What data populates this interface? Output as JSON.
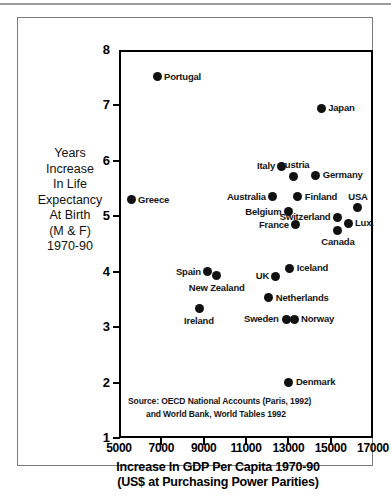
{
  "chart_data": {
    "type": "scatter",
    "title": "",
    "xlabel": "Increase In GDP Per Capita 1970-90 (US$ at Purchasing Power Parities)",
    "ylabel": "Years Increase In Life Expectancy At Birth (M & F) 1970-90",
    "xlim": [
      5000,
      17000
    ],
    "ylim": [
      1,
      8
    ],
    "xticks": [
      "5000",
      "7000",
      "9000",
      "11000",
      "13000",
      "15000",
      "17000"
    ],
    "xtick_values": [
      5000,
      7000,
      9000,
      11000,
      13000,
      15000,
      17000
    ],
    "yticks": [
      "1",
      "2",
      "3",
      "4",
      "5",
      "6",
      "7",
      "8"
    ],
    "ytick_values": [
      1,
      2,
      3,
      4,
      5,
      6,
      7,
      8
    ],
    "grid": false,
    "legend": "none",
    "points": [
      {
        "name": "Portugal",
        "x": 6800,
        "y": 7.52,
        "label_side": "right"
      },
      {
        "name": "Japan",
        "x": 14550,
        "y": 6.95,
        "label_side": "right"
      },
      {
        "name": "Italy",
        "x": 12700,
        "y": 5.9,
        "label_side": "left"
      },
      {
        "name": "Austria",
        "x": 13250,
        "y": 5.72,
        "label_side": "above"
      },
      {
        "name": "Germany",
        "x": 14300,
        "y": 5.74,
        "label_side": "right"
      },
      {
        "name": "Greece",
        "x": 5570,
        "y": 5.3,
        "label_side": "right"
      },
      {
        "name": "Australia",
        "x": 12270,
        "y": 5.35,
        "label_side": "left"
      },
      {
        "name": "Finland",
        "x": 13450,
        "y": 5.35,
        "label_side": "right"
      },
      {
        "name": "USA",
        "x": 16280,
        "y": 5.15,
        "label_side": "above"
      },
      {
        "name": "Belgium",
        "x": 13000,
        "y": 5.08,
        "label_side": "left"
      },
      {
        "name": "Switzerland",
        "x": 15340,
        "y": 4.98,
        "label_side": "left"
      },
      {
        "name": "France",
        "x": 13360,
        "y": 4.85,
        "label_side": "left"
      },
      {
        "name": "Lux.",
        "x": 15820,
        "y": 4.87,
        "label_side": "right"
      },
      {
        "name": "Canada",
        "x": 15340,
        "y": 4.75,
        "label_side": "below"
      },
      {
        "name": "Spain",
        "x": 9200,
        "y": 4.0,
        "label_side": "left"
      },
      {
        "name": "New Zealand",
        "x": 9620,
        "y": 3.93,
        "label_side": "below"
      },
      {
        "name": "Iceland",
        "x": 13070,
        "y": 4.06,
        "label_side": "right"
      },
      {
        "name": "UK",
        "x": 12410,
        "y": 3.92,
        "label_side": "left"
      },
      {
        "name": "Netherlands",
        "x": 12080,
        "y": 3.53,
        "label_side": "right"
      },
      {
        "name": "Ireland",
        "x": 8780,
        "y": 3.33,
        "label_side": "below"
      },
      {
        "name": "Sweden",
        "x": 12890,
        "y": 3.14,
        "label_side": "left"
      },
      {
        "name": "Norway",
        "x": 13270,
        "y": 3.14,
        "label_side": "right"
      },
      {
        "name": "Denmark",
        "x": 13030,
        "y": 2.01,
        "label_side": "right"
      }
    ],
    "source_line1": "Source: OECD National Accounts (Paris, 1992)",
    "source_line2": "and World Bank, World Tables 1992"
  },
  "axis": {
    "ylabel_lines": [
      "Years",
      "Increase",
      "In Life",
      "Expectancy",
      "At Birth",
      "(M & F)",
      "1970-90"
    ],
    "xlabel_line1": "Increase In GDP Per Capita 1970-90",
    "xlabel_line2": "(US$ at Purchasing Power Parities)"
  },
  "colors": {
    "marker": "#111111",
    "axis": "#000000",
    "frame": "#7c7c7c",
    "background": "#ffffff"
  }
}
